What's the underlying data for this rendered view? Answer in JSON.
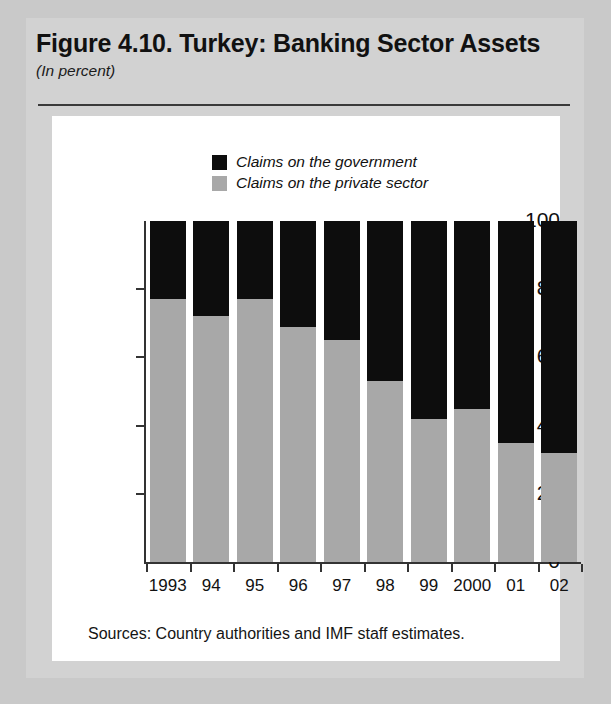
{
  "figure": {
    "title": "Figure 4.10. Turkey: Banking Sector Assets",
    "subtitle": "(In percent)",
    "source": "Sources: Country authorities and IMF staff estimates."
  },
  "colors": {
    "government": "#0d0d0d",
    "private": "#a8a8a8",
    "axis": "#333333",
    "panel_background": "#ffffff",
    "page_background": "#c9c9c9"
  },
  "chart_data": {
    "type": "bar",
    "stacked": true,
    "title": "Figure 4.10. Turkey: Banking Sector Assets",
    "subtitle": "(In percent)",
    "xlabel": "",
    "ylabel": "",
    "ylim": [
      0,
      100
    ],
    "yticks": [
      0,
      20,
      40,
      60,
      80,
      100
    ],
    "ytick_labels": [
      "0",
      "20",
      "40",
      "60",
      "80",
      "100"
    ],
    "grid": false,
    "legend_position": "top-center",
    "categories": [
      "1993",
      "94",
      "95",
      "96",
      "97",
      "98",
      "99",
      "2000",
      "01",
      "02"
    ],
    "series": [
      {
        "name": "Claims on the government",
        "color": "#0d0d0d",
        "values": [
          23,
          28,
          23,
          31,
          35,
          47,
          58,
          55,
          65,
          68
        ]
      },
      {
        "name": "Claims on the private sector",
        "color": "#a8a8a8",
        "values": [
          77,
          72,
          77,
          69,
          65,
          53,
          42,
          45,
          35,
          32
        ]
      }
    ]
  }
}
